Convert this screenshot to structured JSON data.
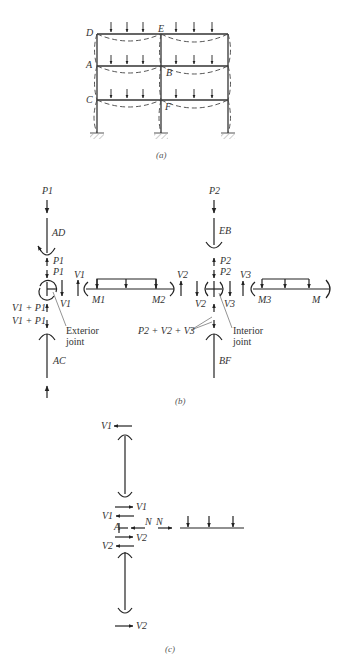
{
  "figure": {
    "header_cut_text": "",
    "part_a": {
      "caption": "(a)",
      "joint_labels": {
        "D": "D",
        "E": "E",
        "A": "A",
        "B": "B",
        "C": "C",
        "F": "F"
      }
    },
    "part_b": {
      "caption": "(b)",
      "exterior": {
        "p_top": "P1",
        "member_top": "AD",
        "p_a": "P1",
        "p_b": "P1",
        "v_right": "V1",
        "v_beam": "V1",
        "m_left": "M1",
        "m_right": "M2",
        "v_beam_right": "V2",
        "vp_a": "V1 + P1",
        "vp_b": "V1 + P1",
        "joint_note_1": "Exterior",
        "joint_note_2": "joint",
        "member_bottom": "AC"
      },
      "interior": {
        "p_top": "P2",
        "member_top": "EB",
        "p_a": "P2",
        "p_b": "P2",
        "v_left": "V2",
        "v_right": "V3",
        "v_beam": "V3",
        "m_left": "M3",
        "m_right": "M",
        "sum_label": "P2 + V2 + V3",
        "joint_note_1": "Interior",
        "joint_note_2": "joint",
        "member_bottom": "BF"
      }
    },
    "part_c": {
      "caption": "(c)",
      "v1_top": "V1",
      "v1_mid": "V1",
      "v1_left": "V1",
      "a_label": "A",
      "n_left": "N",
      "n_right": "N",
      "v2_mid": "V2",
      "v2_left": "V2",
      "v2_bottom": "V2"
    }
  }
}
